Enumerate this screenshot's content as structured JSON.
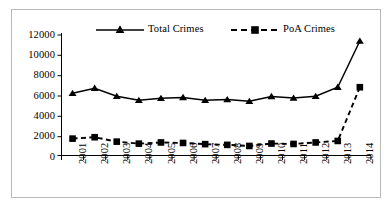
{
  "chart_data": {
    "type": "line",
    "title": "",
    "xlabel": "",
    "ylabel": "",
    "categories": [
      "2001",
      "2002",
      "2003",
      "2004",
      "2005",
      "2006",
      "2007",
      "2008",
      "2009",
      "2010",
      "2011",
      "2012",
      "2013",
      "2014"
    ],
    "series": [
      {
        "name": "Total Crimes",
        "marker": "triangle",
        "line_style": "solid",
        "color": "#000000",
        "values": [
          6200,
          6700,
          5900,
          5500,
          5700,
          5780,
          5500,
          5570,
          5400,
          5880,
          5720,
          5900,
          6800,
          11400
        ]
      },
      {
        "name": "PoA Crimes",
        "marker": "square",
        "line_style": "dashed",
        "color": "#000000",
        "values": [
          1680,
          1820,
          1380,
          1180,
          1300,
          1250,
          1130,
          1060,
          950,
          1190,
          1150,
          1300,
          1450,
          6800
        ]
      }
    ],
    "ylim": [
      0,
      12000
    ],
    "yticks": [
      0,
      2000,
      4000,
      6000,
      8000,
      10000,
      12000
    ],
    "ytick_labels": [
      "0",
      "2000",
      "4000",
      "6000",
      "8000",
      "10000",
      "12000"
    ],
    "grid": false,
    "legend_position": "top"
  },
  "legend": {
    "entries": [
      {
        "label": "Total Crimes"
      },
      {
        "label": "PoA Crimes"
      }
    ]
  },
  "axes": {
    "y_tick_labels": [
      "12000",
      "10000",
      "8000",
      "6000",
      "4000",
      "2000",
      "0"
    ],
    "x_tick_labels": [
      "2001",
      "2002",
      "2003",
      "2004",
      "2005",
      "2006",
      "2007",
      "2008",
      "2009",
      "2010",
      "2011",
      "2012",
      "2013",
      "2014"
    ]
  }
}
